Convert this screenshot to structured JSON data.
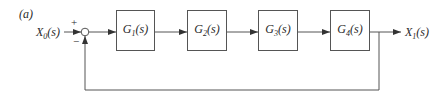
{
  "figure": {
    "panel_label": "(a)",
    "input": {
      "label": "X",
      "sub": "0",
      "arg": "(s)"
    },
    "output": {
      "label": "X",
      "sub": "1",
      "arg": "(s)"
    },
    "summing_junction": {
      "plus_sign": "+",
      "minus_sign": "−"
    },
    "blocks": [
      {
        "name": "G",
        "sub": "1",
        "arg": "(s)"
      },
      {
        "name": "G",
        "sub": "2",
        "arg": "(s)"
      },
      {
        "name": "G",
        "sub": "3",
        "arg": "(s)"
      },
      {
        "name": "G",
        "sub": "4",
        "arg": "(s)"
      }
    ],
    "feedback": "unity negative feedback from X1(s) to summing junction"
  },
  "colors": {
    "line": "#555555",
    "text": "#2a2a2a",
    "background": "#ffffff"
  }
}
